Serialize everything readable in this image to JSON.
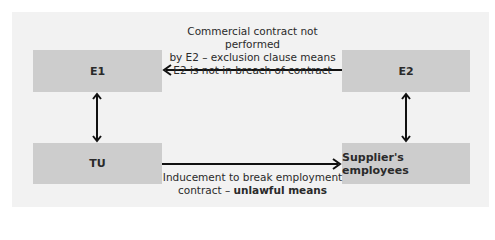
{
  "diagram": {
    "nodes": {
      "e1": {
        "label": "E1"
      },
      "e2": {
        "label": "E2"
      },
      "tu": {
        "label": "TU"
      },
      "suppliers_employees": {
        "label": "Supplier's employees"
      }
    },
    "edges": {
      "e2_to_e1": {
        "from": "E2",
        "to": "E1",
        "line1": "Commercial contract not performed",
        "line2": "by E2 – exclusion clause means",
        "line3": "E2 is not in breach of contract"
      },
      "tu_to_suppliers": {
        "from": "TU",
        "to": "Supplier's employees",
        "line1": "Inducement to break employment",
        "line2_plain": "contract – ",
        "line2_bold": "unlawful means"
      },
      "e1_tu": {
        "from": "E1",
        "to": "TU",
        "direction": "bidirectional"
      },
      "e2_suppliers": {
        "from": "E2",
        "to": "Supplier's employees",
        "direction": "bidirectional"
      }
    },
    "colors": {
      "panel": "#f2f2f2",
      "box": "#cdcdcd",
      "arrow": "#111111",
      "text": "#2a2a2a"
    }
  }
}
